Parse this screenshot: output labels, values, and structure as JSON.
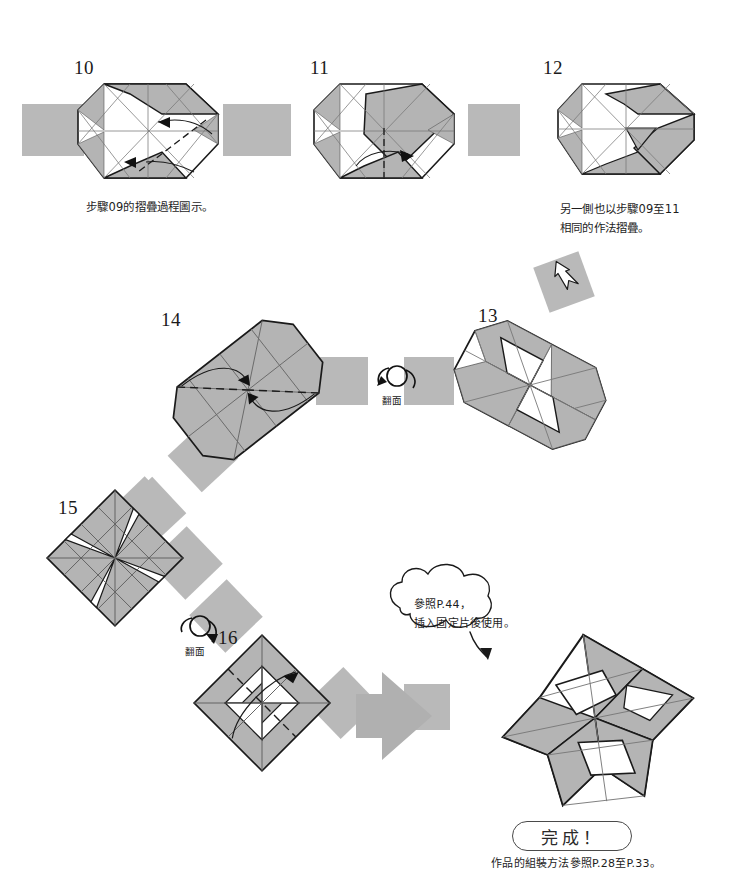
{
  "page": {
    "kind": "origami-instruction-diagram",
    "background": "#ffffff",
    "width": 741,
    "height": 872
  },
  "palette": {
    "band_gray": "#b9b9b9",
    "paper_shade": "#b4b4b4",
    "paper_white": "#ffffff",
    "ink": "#1a1a1a",
    "thin_line": "#6e6e6e",
    "arrow_gray": "#b0b0b0"
  },
  "steps": [
    {
      "id": "step-10",
      "number": "10",
      "num_pos": {
        "x": 74,
        "y": 58
      },
      "caption": "步驟09的摺疊過程圖示。",
      "caption_pos": {
        "x": 86,
        "y": 198
      }
    },
    {
      "id": "step-11",
      "number": "11",
      "num_pos": {
        "x": 310,
        "y": 58
      },
      "caption": "",
      "caption_pos": {
        "x": 0,
        "y": 0
      }
    },
    {
      "id": "step-12",
      "number": "12",
      "num_pos": {
        "x": 543,
        "y": 58
      },
      "caption": "另一側也以步驟09至11\n相同的作法摺疊。",
      "caption_pos": {
        "x": 560,
        "y": 200
      }
    },
    {
      "id": "step-13",
      "number": "13",
      "num_pos": {
        "x": 478,
        "y": 306
      },
      "caption": "",
      "caption_pos": {
        "x": 0,
        "y": 0
      }
    },
    {
      "id": "step-14",
      "number": "14",
      "num_pos": {
        "x": 161,
        "y": 310
      },
      "caption": "",
      "caption_pos": {
        "x": 0,
        "y": 0
      }
    },
    {
      "id": "step-15",
      "number": "15",
      "num_pos": {
        "x": 58,
        "y": 498
      },
      "caption": "",
      "caption_pos": {
        "x": 0,
        "y": 0
      }
    },
    {
      "id": "step-16",
      "number": "16",
      "num_pos": {
        "x": 218,
        "y": 628
      },
      "caption": "",
      "caption_pos": {
        "x": 0,
        "y": 0
      }
    }
  ],
  "flip_symbols": [
    {
      "id": "flip-upper",
      "label": "翻面",
      "x": 382,
      "y": 396
    },
    {
      "id": "flip-lower",
      "label": "翻面",
      "x": 185,
      "y": 647
    }
  ],
  "callout": {
    "text": "參照P.44，\n插入固定片後使用。",
    "pos": {
      "x": 414,
      "y": 595
    }
  },
  "completion": {
    "badge_label": "完成！",
    "badge_pos": {
      "x": 512,
      "y": 821,
      "w": 120,
      "h": 30
    },
    "note": "作品的組裝方法參照P.28至P.33。",
    "note_pos": {
      "x": 451,
      "y": 856
    }
  },
  "connectors": [
    {
      "id": "band-left-of-10",
      "type": "horizontal-band"
    },
    {
      "id": "band-10-to-11",
      "type": "horizontal-band"
    },
    {
      "id": "band-11-to-12",
      "type": "horizontal-band"
    },
    {
      "id": "band-12-to-13",
      "type": "diagonal-band",
      "arrow": "white-down-arrow"
    },
    {
      "id": "band-13-to-14",
      "type": "horizontal-band",
      "arrow": "flip-over"
    },
    {
      "id": "band-14-to-15",
      "type": "diagonal-band"
    },
    {
      "id": "band-15-to-16",
      "type": "diagonal-band",
      "arrow": "flip-over"
    },
    {
      "id": "band-16-to-final",
      "type": "big-gray-arrow"
    }
  ]
}
